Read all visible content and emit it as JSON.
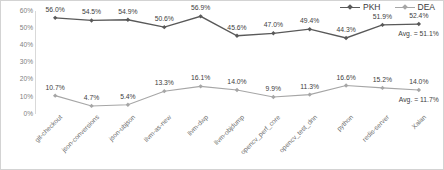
{
  "chart_data": {
    "type": "line",
    "title": "",
    "xlabel": "",
    "ylabel": "",
    "ylim": [
      0,
      60
    ],
    "grid": false,
    "legend_position": "top-right",
    "categories": [
      "git-checkout",
      "json-conversions",
      "json-ubjson",
      "llvm-as-new",
      "llvm-dwp",
      "llvm-objdump",
      "opencv_perf_core",
      "opencv_test_dnn",
      "python",
      "redis-server",
      "Xalan"
    ],
    "ytick_labels": [
      "60%",
      "50%",
      "40%",
      "30%",
      "20%",
      "10%",
      "0%"
    ],
    "ytick_values": [
      60,
      50,
      40,
      30,
      20,
      10,
      0
    ],
    "series": [
      {
        "name": "PKH",
        "color": "#595959",
        "marker": "diamond",
        "values": [
          56.0,
          54.5,
          54.9,
          50.6,
          56.9,
          45.6,
          47.0,
          49.4,
          44.3,
          51.9,
          52.4
        ],
        "value_labels": [
          "56.0%",
          "54.5%",
          "54.9%",
          "50.6%",
          "56.9%",
          "45.6%",
          "47.0%",
          "49.4%",
          "44.3%",
          "51.9%",
          "52.4%"
        ],
        "average_label": "Avg. = 51.1%",
        "average_value": 51.1
      },
      {
        "name": "DEA",
        "color": "#a6a6a6",
        "marker": "diamond",
        "values": [
          10.7,
          4.7,
          5.4,
          13.3,
          16.1,
          14.0,
          9.9,
          11.3,
          16.6,
          15.2,
          14.0
        ],
        "value_labels": [
          "10.7%",
          "4.7%",
          "5.4%",
          "13.3%",
          "16.1%",
          "14.0%",
          "9.9%",
          "11.3%",
          "16.6%",
          "15.2%",
          "14.0%"
        ],
        "average_label": "Avg. = 11.7%",
        "average_value": 11.7
      }
    ]
  }
}
